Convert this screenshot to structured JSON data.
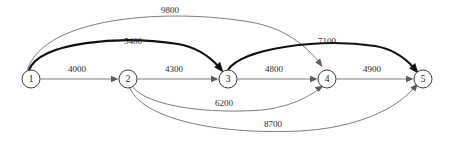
{
  "diagram": {
    "nodes": [
      {
        "id": "1",
        "label": "1",
        "cx": 31,
        "cy": 79,
        "r": 9
      },
      {
        "id": "2",
        "label": "2",
        "cx": 128,
        "cy": 79,
        "r": 9
      },
      {
        "id": "3",
        "label": "3",
        "cx": 228,
        "cy": 79,
        "r": 9
      },
      {
        "id": "4",
        "label": "4",
        "cx": 327,
        "cy": 79,
        "r": 9
      },
      {
        "id": "5",
        "label": "5",
        "cx": 423,
        "cy": 79,
        "r": 9
      }
    ],
    "edges": [
      {
        "from": "1",
        "to": "2",
        "weight": "4000",
        "style": "thin",
        "label_x": 77,
        "label_y": 70
      },
      {
        "from": "2",
        "to": "3",
        "weight": "4300",
        "style": "thin",
        "label_x": 174,
        "label_y": 70
      },
      {
        "from": "3",
        "to": "4",
        "weight": "4800",
        "style": "thin",
        "label_x": 274,
        "label_y": 70
      },
      {
        "from": "4",
        "to": "5",
        "weight": "4900",
        "style": "thin",
        "label_x": 372,
        "label_y": 70
      },
      {
        "from": "1",
        "to": "3",
        "weight": "5400",
        "style": "thick",
        "label_x": 133,
        "label_y": 42
      },
      {
        "from": "3",
        "to": "5",
        "weight": "7100",
        "style": "thick",
        "label_x": 327,
        "label_y": 42
      },
      {
        "from": "1",
        "to": "4",
        "weight": "9800",
        "style": "thin",
        "label_x": 170,
        "label_y": 11
      },
      {
        "from": "2",
        "to": "4",
        "weight": "6200",
        "style": "thin",
        "label_x": 224,
        "label_y": 104
      },
      {
        "from": "2",
        "to": "5",
        "weight": "8700",
        "style": "thin",
        "label_x": 273,
        "label_y": 125
      }
    ],
    "colors": {
      "background": "#ffffff",
      "node_stroke": "#3a3a3a",
      "node_fill": "#ffffff",
      "edge_thin": "#6e6e6e",
      "edge_thick": "#111111",
      "label_text": "#2b2b2b"
    }
  }
}
